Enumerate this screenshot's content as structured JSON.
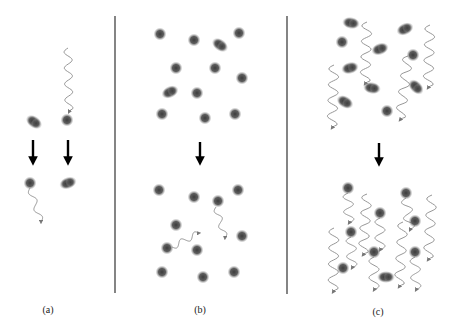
{
  "figure": {
    "colors": {
      "background": "#ffffff",
      "atom": "#4a4a4a",
      "molecule": "#5a5a5a",
      "photon": "#8a8a8a",
      "arrow": "#000000",
      "divider": "#333333",
      "label": "#222222"
    },
    "dividers": [
      {
        "x": 115,
        "y1": 16,
        "y2": 293
      },
      {
        "x": 287,
        "y1": 16,
        "y2": 294
      }
    ],
    "panels": [
      {
        "id": "a",
        "label": "(a)",
        "label_pos": {
          "x": 48,
          "y": 304
        },
        "arrows": [
          {
            "x": 33,
            "y1": 140,
            "y2": 167
          },
          {
            "x": 68,
            "y1": 140,
            "y2": 167
          }
        ],
        "atoms": [
          {
            "x": 67,
            "y": 120
          },
          {
            "x": 30,
            "y": 183
          }
        ],
        "molecules": [
          {
            "x": 34,
            "y": 122,
            "angle": 35
          },
          {
            "x": 68,
            "y": 183,
            "angle": -20
          }
        ],
        "photons": [
          {
            "x1": 68,
            "y1": 48,
            "x2": 69,
            "y2": 112,
            "amp": 4,
            "waves": 4
          },
          {
            "x1": 30,
            "y1": 188,
            "x2": 41,
            "y2": 222,
            "amp": 3,
            "waves": 2
          }
        ]
      },
      {
        "id": "b",
        "label": "(b)",
        "label_pos": {
          "x": 200,
          "y": 304
        },
        "arrows": [
          {
            "x": 200,
            "y1": 142,
            "y2": 167
          }
        ],
        "atoms": [
          {
            "x": 160,
            "y": 34
          },
          {
            "x": 194,
            "y": 40
          },
          {
            "x": 239,
            "y": 33
          },
          {
            "x": 176,
            "y": 68
          },
          {
            "x": 215,
            "y": 68
          },
          {
            "x": 242,
            "y": 78
          },
          {
            "x": 197,
            "y": 93
          },
          {
            "x": 162,
            "y": 114
          },
          {
            "x": 205,
            "y": 118
          },
          {
            "x": 235,
            "y": 114
          },
          {
            "x": 159,
            "y": 190
          },
          {
            "x": 194,
            "y": 197
          },
          {
            "x": 238,
            "y": 190
          },
          {
            "x": 218,
            "y": 201
          },
          {
            "x": 176,
            "y": 225
          },
          {
            "x": 242,
            "y": 236
          },
          {
            "x": 167,
            "y": 248
          },
          {
            "x": 197,
            "y": 250
          },
          {
            "x": 162,
            "y": 272
          },
          {
            "x": 203,
            "y": 277
          },
          {
            "x": 234,
            "y": 272
          }
        ],
        "molecules": [
          {
            "x": 220,
            "y": 45,
            "angle": 35
          },
          {
            "x": 170,
            "y": 92,
            "angle": -25
          }
        ],
        "photons": [
          {
            "x1": 216,
            "y1": 207,
            "x2": 225,
            "y2": 238,
            "amp": 3,
            "waves": 2
          },
          {
            "x1": 172,
            "y1": 247,
            "x2": 199,
            "y2": 233,
            "amp": 3,
            "waves": 2
          }
        ]
      },
      {
        "id": "c",
        "label": "(c)",
        "label_pos": {
          "x": 378,
          "y": 306
        },
        "arrows": [
          {
            "x": 379,
            "y1": 143,
            "y2": 168
          }
        ],
        "atoms": [
          {
            "x": 342,
            "y": 42
          },
          {
            "x": 413,
            "y": 55
          },
          {
            "x": 387,
            "y": 111
          },
          {
            "x": 348,
            "y": 188
          },
          {
            "x": 406,
            "y": 193
          },
          {
            "x": 380,
            "y": 213
          },
          {
            "x": 415,
            "y": 221
          },
          {
            "x": 351,
            "y": 232
          },
          {
            "x": 374,
            "y": 252
          },
          {
            "x": 415,
            "y": 252
          },
          {
            "x": 343,
            "y": 268
          }
        ],
        "molecules": [
          {
            "x": 351,
            "y": 23,
            "angle": 10
          },
          {
            "x": 405,
            "y": 29,
            "angle": -25
          },
          {
            "x": 380,
            "y": 49,
            "angle": -20
          },
          {
            "x": 350,
            "y": 68,
            "angle": -15
          },
          {
            "x": 372,
            "y": 88,
            "angle": 10
          },
          {
            "x": 416,
            "y": 87,
            "angle": 45
          },
          {
            "x": 345,
            "y": 102,
            "angle": 30
          },
          {
            "x": 386,
            "y": 277,
            "angle": 0
          }
        ],
        "photons": [
          {
            "x1": 367,
            "y1": 22,
            "x2": 365,
            "y2": 84,
            "amp": 5,
            "waves": 4
          },
          {
            "x1": 334,
            "y1": 65,
            "x2": 332,
            "y2": 128,
            "amp": 5,
            "waves": 4
          },
          {
            "x1": 408,
            "y1": 56,
            "x2": 400,
            "y2": 120,
            "amp": 5,
            "waves": 4
          },
          {
            "x1": 430,
            "y1": 25,
            "x2": 428,
            "y2": 88,
            "amp": 5,
            "waves": 4
          },
          {
            "x1": 348,
            "y1": 193,
            "x2": 349,
            "y2": 223,
            "amp": 5,
            "waves": 2
          },
          {
            "x1": 367,
            "y1": 194,
            "x2": 363,
            "y2": 255,
            "amp": 5,
            "waves": 4
          },
          {
            "x1": 406,
            "y1": 198,
            "x2": 410,
            "y2": 230,
            "amp": 5,
            "waves": 2
          },
          {
            "x1": 432,
            "y1": 195,
            "x2": 428,
            "y2": 260,
            "amp": 5,
            "waves": 4
          },
          {
            "x1": 380,
            "y1": 218,
            "x2": 380,
            "y2": 250,
            "amp": 5,
            "waves": 2
          },
          {
            "x1": 351,
            "y1": 237,
            "x2": 352,
            "y2": 268,
            "amp": 5,
            "waves": 2
          },
          {
            "x1": 334,
            "y1": 228,
            "x2": 333,
            "y2": 292,
            "amp": 5,
            "waves": 4
          },
          {
            "x1": 403,
            "y1": 222,
            "x2": 399,
            "y2": 287,
            "amp": 5,
            "waves": 4
          },
          {
            "x1": 374,
            "y1": 257,
            "x2": 374,
            "y2": 290,
            "amp": 5,
            "waves": 2
          },
          {
            "x1": 415,
            "y1": 257,
            "x2": 416,
            "y2": 290,
            "amp": 5,
            "waves": 2
          }
        ]
      }
    ]
  }
}
